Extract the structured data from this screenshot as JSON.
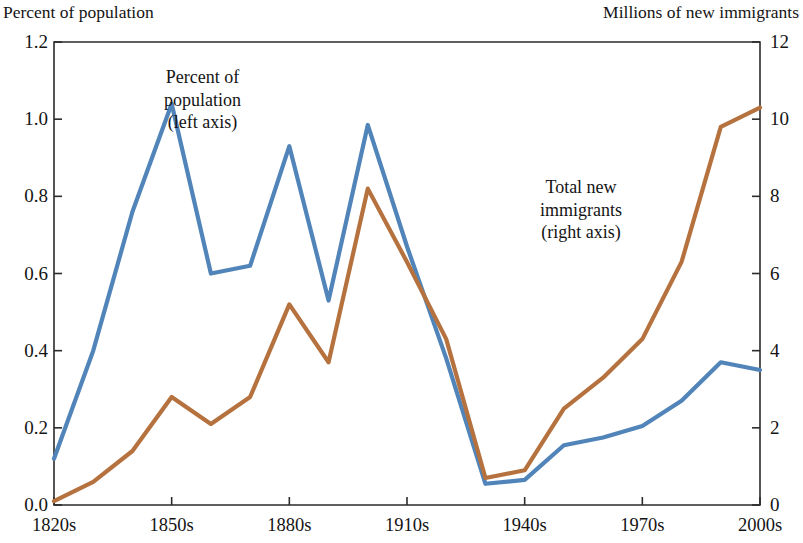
{
  "chart_data": {
    "type": "line",
    "title": "",
    "subtitle": "",
    "left_axis_caption": "Percent of population",
    "right_axis_caption": "Millions of new immigrants",
    "xlabel": "",
    "ylabel": "Percent of population",
    "ylabel_right": "Millions of new immigrants",
    "grid": false,
    "legend_position": "in-plot annotations",
    "ylim": [
      0.0,
      1.2
    ],
    "ylim_right": [
      0,
      12
    ],
    "yticks": [
      "0.0",
      "0.2",
      "0.4",
      "0.6",
      "0.8",
      "1.0",
      "1.2"
    ],
    "ytick_values": [
      0.0,
      0.2,
      0.4,
      0.6,
      0.8,
      1.0,
      1.2
    ],
    "yticks_right": [
      "0",
      "2",
      "4",
      "6",
      "8",
      "10",
      "12"
    ],
    "ytick_values_right": [
      0,
      2,
      4,
      6,
      8,
      10,
      12
    ],
    "categories": [
      "1820s",
      "1830s",
      "1840s",
      "1850s",
      "1860s",
      "1870s",
      "1880s",
      "1890s",
      "1900s",
      "1910s",
      "1920s",
      "1930s",
      "1940s",
      "1950s",
      "1960s",
      "1970s",
      "1980s",
      "1990s",
      "2000s"
    ],
    "xtick_labels": [
      "1820s",
      "1850s",
      "1880s",
      "1910s",
      "1940s",
      "1970s",
      "2000s"
    ],
    "xtick_indices": [
      0,
      3,
      6,
      9,
      12,
      15,
      18
    ],
    "series": [
      {
        "name": "Percent of population (left axis)",
        "axis": "left",
        "color": "#5184B8",
        "values": [
          0.12,
          0.4,
          0.76,
          1.04,
          0.6,
          0.62,
          0.93,
          0.53,
          0.985,
          0.67,
          0.38,
          0.055,
          0.065,
          0.155,
          0.175,
          0.205,
          0.27,
          0.37,
          0.35
        ]
      },
      {
        "name": "Total new immigrants (right axis)",
        "axis": "right",
        "color": "#B5723F",
        "values": [
          0.1,
          0.6,
          1.4,
          2.8,
          2.1,
          2.8,
          5.2,
          3.7,
          8.2,
          6.3,
          4.3,
          0.7,
          0.9,
          2.5,
          3.3,
          4.3,
          6.3,
          9.8,
          10.3
        ]
      }
    ],
    "annotations": [
      {
        "id": "percent-of-population",
        "lines": [
          "Percent of",
          "population",
          "(left axis)"
        ]
      },
      {
        "id": "total-new-immigrants",
        "lines": [
          "Total new",
          "immigrants",
          "(right axis)"
        ]
      }
    ]
  }
}
